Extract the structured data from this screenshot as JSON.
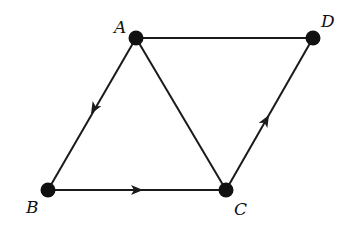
{
  "diagram": {
    "type": "directed-graph",
    "vertices": [
      {
        "id": "A",
        "label": "A",
        "x": 136,
        "y": 38,
        "label_x": 114,
        "label_y": 32
      },
      {
        "id": "B",
        "label": "B",
        "x": 48,
        "y": 190,
        "label_x": 26,
        "label_y": 212
      },
      {
        "id": "C",
        "label": "C",
        "x": 226,
        "y": 190,
        "label_x": 234,
        "label_y": 214
      },
      {
        "id": "D",
        "label": "D",
        "x": 313,
        "y": 38,
        "label_x": 322,
        "label_y": 26
      }
    ],
    "edges": [
      {
        "from": "A",
        "to": "D",
        "directed": false
      },
      {
        "from": "A",
        "to": "B",
        "directed": true
      },
      {
        "from": "B",
        "to": "C",
        "directed": true
      },
      {
        "from": "C",
        "to": "D",
        "directed": true
      },
      {
        "from": "A",
        "to": "C",
        "directed": false
      }
    ],
    "colors": {
      "stroke": "#1a1a1a",
      "vertex": "#111111",
      "background": "#ffffff"
    }
  }
}
